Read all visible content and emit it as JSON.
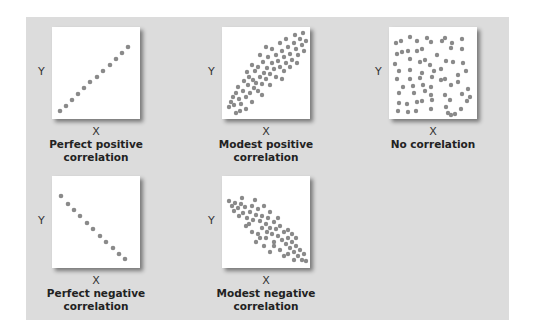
{
  "colors": {
    "panel": "#dcdcdc",
    "plot_bg": "#ffffff",
    "dot": "#8a8a8a"
  },
  "axis": {
    "x": "X",
    "y": "Y"
  },
  "plots": [
    {
      "id": "perfect-positive",
      "caption_line1": "Perfect positive",
      "caption_line2": "correlation"
    },
    {
      "id": "modest-positive",
      "caption_line1": "Modest positive",
      "caption_line2": "correlation"
    },
    {
      "id": "no-correlation",
      "caption_line1": "No correlation",
      "caption_line2": ""
    },
    {
      "id": "perfect-negative",
      "caption_line1": "Perfect negative",
      "caption_line2": "correlation"
    },
    {
      "id": "modest-negative",
      "caption_line1": "Modest negative",
      "caption_line2": "correlation"
    }
  ]
}
